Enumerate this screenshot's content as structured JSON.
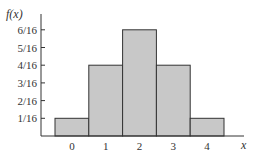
{
  "chart_data": {
    "type": "bar",
    "title": "",
    "xlabel": "x",
    "ylabel": "f(x)",
    "categories": [
      "0",
      "1",
      "2",
      "3",
      "4"
    ],
    "values": [
      0.0625,
      0.25,
      0.375,
      0.25,
      0.0625
    ],
    "value_labels": [
      "1/16",
      "4/16",
      "6/16",
      "4/16",
      "1/16"
    ],
    "numerators": [
      1,
      4,
      6,
      4,
      1
    ],
    "yticks": [
      "1/16",
      "2/16",
      "3/16",
      "4/16",
      "5/16",
      "6/16"
    ],
    "ylim": [
      0,
      0.40625
    ],
    "grid": false,
    "legend": null,
    "bar_color": "#c8c8c8",
    "edge_color": "#333333"
  }
}
